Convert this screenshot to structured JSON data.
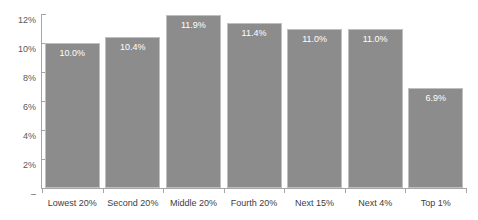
{
  "chart_data": {
    "type": "bar",
    "title": "",
    "subtitle": "",
    "xlabel": "",
    "ylabel": "",
    "categories": [
      "Lowest 20%",
      "Second 20%",
      "Middle 20%",
      "Fourth 20%",
      "Next 15%",
      "Next 4%",
      "Top 1%"
    ],
    "values": [
      10.0,
      10.4,
      11.9,
      11.4,
      11.0,
      11.0,
      6.9
    ],
    "data_labels": [
      "10.0%",
      "10.4%",
      "11.9%",
      "11.4%",
      "11.0%",
      "11.0%",
      "6.9%"
    ],
    "ylim": [
      0,
      12
    ],
    "y_ticks": [
      0,
      2,
      4,
      6,
      8,
      10,
      12
    ],
    "y_tick_labels": [
      "–",
      "2%",
      "4%",
      "6%",
      "8%",
      "10%",
      "12%"
    ],
    "grid": false,
    "legend": null,
    "series_color": "#8c8c8c",
    "data_label_color": "#ffffff",
    "axis_color": "#a6a6a6",
    "tick_text_color": "#595959",
    "category_text_color": "#404040",
    "background": "#ffffff"
  }
}
